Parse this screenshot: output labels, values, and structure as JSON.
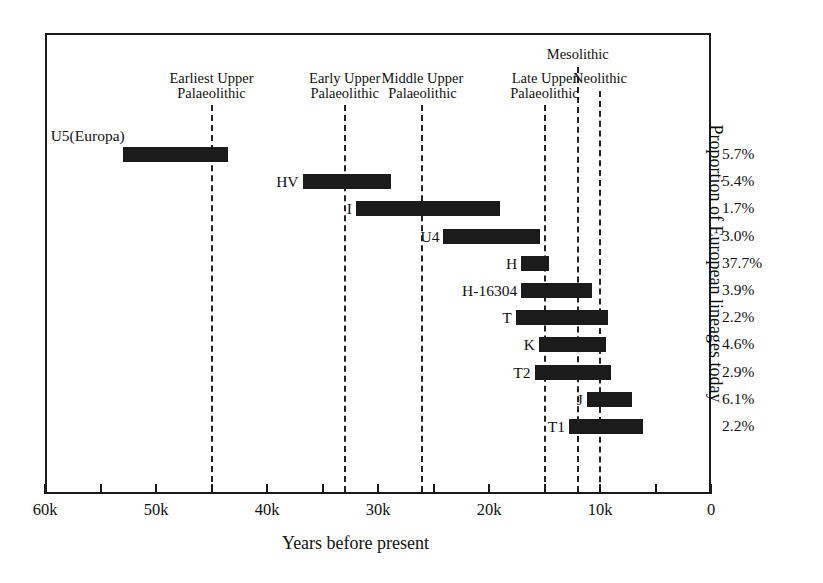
{
  "chart_data": {
    "type": "bar",
    "title": "",
    "subtitle": "",
    "xlabel": "Years before present",
    "ylabel": "Proportion of European lineages today",
    "orientation": "horizontal",
    "xlim": [
      60000,
      0
    ],
    "x_axis_direction": "reversed",
    "grid": false,
    "legend": "none",
    "xticks": [
      {
        "value": 60000,
        "label": "60k",
        "major": true
      },
      {
        "value": 55000,
        "label": "",
        "major": false
      },
      {
        "value": 50000,
        "label": "50k",
        "major": true
      },
      {
        "value": 45000,
        "label": "",
        "major": false
      },
      {
        "value": 40000,
        "label": "40k",
        "major": true
      },
      {
        "value": 35000,
        "label": "",
        "major": false
      },
      {
        "value": 30000,
        "label": "30k",
        "major": true
      },
      {
        "value": 25000,
        "label": "",
        "major": false
      },
      {
        "value": 20000,
        "label": "20k",
        "major": true
      },
      {
        "value": 15000,
        "label": "",
        "major": false
      },
      {
        "value": 10000,
        "label": "10k",
        "major": true
      },
      {
        "value": 5000,
        "label": "",
        "major": false
      },
      {
        "value": 0,
        "label": "0",
        "major": true
      }
    ],
    "categories": [
      "U5(Europa)",
      "HV",
      "I",
      "U4",
      "H",
      "H-16304",
      "T",
      "K",
      "T2",
      "J",
      "T1"
    ],
    "annotations": [
      {
        "name": "Earliest Upper Palaeolithic",
        "label_line1": "Earliest Upper",
        "label_line2": "Palaeolithic",
        "value": 45000
      },
      {
        "name": "Early Upper Palaeolithic",
        "label_line1": "Early Upper",
        "label_line2": "Palaeolithic",
        "value": 33000
      },
      {
        "name": "Middle Upper Palaeolithic",
        "label_line1": "Middle Upper",
        "label_line2": "Palaeolithic",
        "value": 26000
      },
      {
        "name": "Late Upper Palaeolithic",
        "label_line1": "Late Upper",
        "label_line2": "Palaeolithic",
        "value": 15000
      },
      {
        "name": "Mesolithic",
        "label_line1": "Mesolithic",
        "label_line2": "",
        "value": 12000
      },
      {
        "name": "Neolithic",
        "label_line1": "Neolithic",
        "label_line2": "",
        "value": 10000
      }
    ],
    "bars": [
      {
        "label": "U5(Europa)",
        "start": 53000,
        "end": 43500,
        "percent": "5.7%"
      },
      {
        "label": "HV",
        "start": 36800,
        "end": 28800,
        "percent": "5.4%"
      },
      {
        "label": "I",
        "start": 32000,
        "end": 19000,
        "percent": "1.7%"
      },
      {
        "label": "U4",
        "start": 24100,
        "end": 15400,
        "percent": "3.0%"
      },
      {
        "label": "H",
        "start": 17100,
        "end": 14600,
        "percent": "37.7%"
      },
      {
        "label": "H-16304",
        "start": 17100,
        "end": 10700,
        "percent": "3.9%"
      },
      {
        "label": "T",
        "start": 17600,
        "end": 9300,
        "percent": "2.2%"
      },
      {
        "label": "K",
        "start": 15500,
        "end": 9500,
        "percent": "4.6%"
      },
      {
        "label": "T2",
        "start": 15900,
        "end": 9000,
        "percent": "2.9%"
      },
      {
        "label": "J",
        "start": 11200,
        "end": 7100,
        "percent": "6.1%"
      },
      {
        "label": "T1",
        "start": 12800,
        "end": 6100,
        "percent": "2.2%"
      }
    ]
  }
}
